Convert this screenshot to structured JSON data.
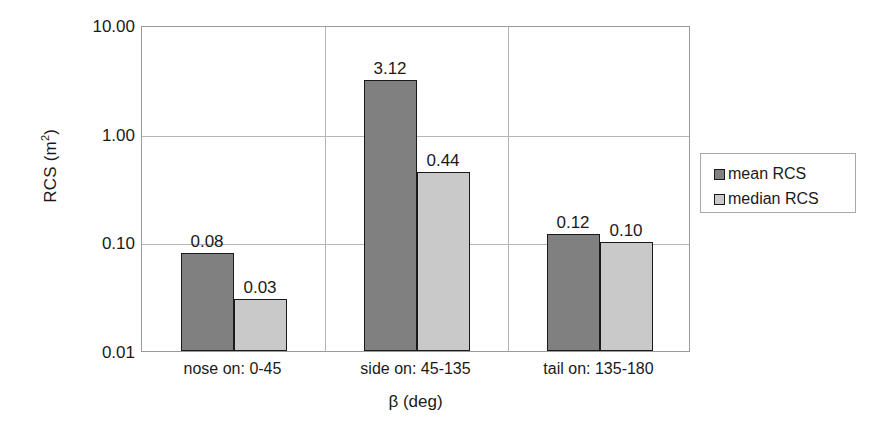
{
  "chart_data": {
    "type": "bar",
    "title": "",
    "xlabel": "β (deg)",
    "ylabel": "RCS (m²)",
    "ylabel_base": "RCS (m",
    "ylabel_sup": "2",
    "ylabel_tail": ")",
    "yscale": "log",
    "ylim": [
      0.01,
      10.0
    ],
    "grid": true,
    "legend_position": "right",
    "categories": [
      "nose on:  0-45",
      "side on: 45-135",
      "tail on: 135-180"
    ],
    "ytick_labels": [
      "10.00",
      "1.00",
      "0.10",
      "0.01"
    ],
    "ytick_values": [
      10.0,
      1.0,
      0.1,
      0.01
    ],
    "series": [
      {
        "name": "mean RCS",
        "color": "#808080",
        "values": [
          0.08,
          3.12,
          0.12
        ],
        "labels": [
          "0.08",
          "3.12",
          "0.12"
        ]
      },
      {
        "name": "median RCS",
        "color": "#c9c9c9",
        "values": [
          0.03,
          0.44,
          0.1
        ],
        "labels": [
          "0.03",
          "0.44",
          "0.10"
        ]
      }
    ]
  },
  "axes": {
    "y_title": "RCS (m",
    "y_title_sup": "2",
    "y_title_close": ")",
    "x_title": "β (deg)"
  },
  "legend": {
    "items": [
      {
        "label": "mean RCS",
        "color": "#808080"
      },
      {
        "label": "median RCS",
        "color": "#c9c9c9"
      }
    ]
  }
}
